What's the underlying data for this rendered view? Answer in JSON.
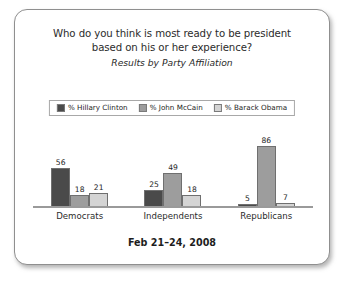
{
  "chart_data": {
    "type": "bar",
    "title_lines": [
      "Who do you think is most ready to be president",
      "based on his or her experience?"
    ],
    "subtitle": "Results by Party Affiliation",
    "categories": [
      "Democrats",
      "Independents",
      "Republicans"
    ],
    "series": [
      {
        "name": "% Hillary Clinton",
        "color": "#4a4a4a",
        "values": [
          56,
          18,
          21
        ]
      },
      {
        "name": "% John McCain",
        "color": "#9d9d9d",
        "values": [
          25,
          49,
          18
        ]
      },
      {
        "name": "% Barack Obama",
        "color": "#d4d4d4",
        "values": [
          5,
          86,
          7
        ]
      }
    ],
    "groups": [
      {
        "category": "Democrats",
        "values": [
          56,
          18,
          21
        ]
      },
      {
        "category": "Independents",
        "values": [
          25,
          49,
          18
        ]
      },
      {
        "category": "Republicans",
        "values": [
          5,
          86,
          7
        ]
      }
    ],
    "xlabel": "",
    "ylabel": "",
    "ylim": [
      0,
      100
    ],
    "grid": false,
    "legend_position": "top-center",
    "axis_labels_shown": false,
    "data_labels_shown": true
  },
  "footer": {
    "date": "Feb 21–24, 2008"
  },
  "colors": {
    "clinton": "#4a4a4a",
    "mccain": "#9d9d9d",
    "obama": "#d4d4d4",
    "card_border": "#8f8f8f",
    "baseline": "#9a9a9a",
    "text": "#2b2b2b"
  }
}
